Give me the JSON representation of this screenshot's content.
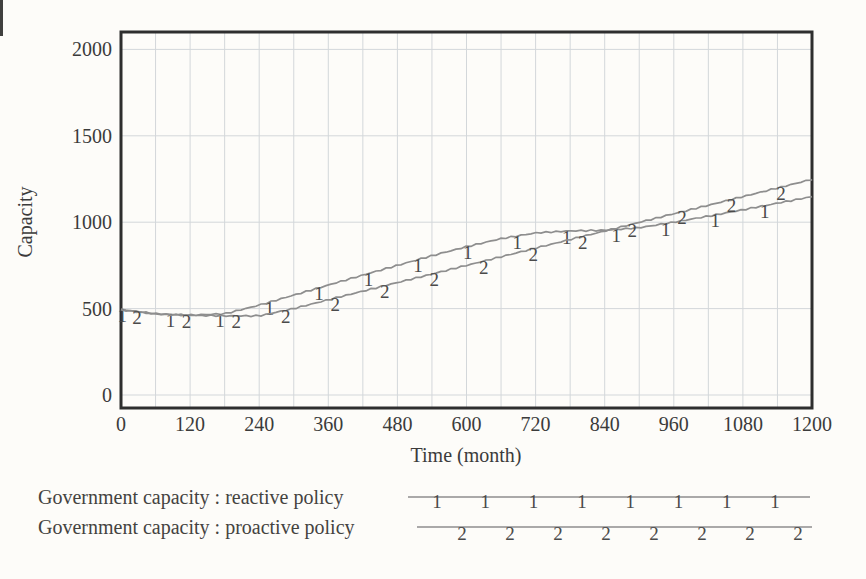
{
  "colors": {
    "background": "#fdfcf9",
    "frame": "#2e2e2e",
    "grid": "#d3d7da",
    "curve": "#8e8e8e",
    "marker": "#4a4a4a",
    "text": "#3b3b3b"
  },
  "chart_data": {
    "type": "line",
    "title": "",
    "xlabel": "Time (month)",
    "ylabel": "Capacity",
    "xlim": [
      0,
      1200
    ],
    "ylim": [
      0,
      2000
    ],
    "grid": true,
    "x_minor_step": 60,
    "x_ticks": [
      0,
      120,
      240,
      360,
      480,
      600,
      720,
      840,
      960,
      1080,
      1200
    ],
    "y_ticks": [
      0,
      500,
      1000,
      1500,
      2000
    ],
    "x": [
      0,
      60,
      120,
      180,
      240,
      300,
      360,
      420,
      480,
      540,
      600,
      660,
      720,
      780,
      840,
      900,
      960,
      1020,
      1080,
      1140,
      1200
    ],
    "series": [
      {
        "id": "reactive-policy",
        "name": "Government capacity : reactive policy",
        "symbol": "1",
        "color": "#8e8e8e",
        "values": [
          495,
          470,
          462,
          470,
          520,
          578,
          636,
          694,
          750,
          806,
          858,
          905,
          938,
          950,
          953,
          968,
          1000,
          1035,
          1072,
          1110,
          1148
        ],
        "marker_t": [
          2,
          86,
          172,
          258,
          344,
          430,
          516,
          602,
          688,
          774,
          860,
          946,
          1032,
          1118
        ]
      },
      {
        "id": "proactive-policy",
        "name": "Government capacity : proactive policy",
        "symbol": "2",
        "color": "#8e8e8e",
        "values": [
          492,
          468,
          461,
          458,
          458,
          500,
          551,
          601,
          651,
          700,
          750,
          800,
          850,
          900,
          949,
          999,
          1049,
          1098,
          1148,
          1198,
          1248
        ],
        "marker_t": [
          28,
          114,
          200,
          286,
          372,
          458,
          544,
          630,
          716,
          802,
          888,
          974,
          1060,
          1146
        ]
      }
    ],
    "legend": {
      "position": "bottom-left",
      "markers_per_sample": 8,
      "entries": [
        "Government capacity : reactive policy",
        "Government capacity : proactive policy"
      ]
    }
  }
}
